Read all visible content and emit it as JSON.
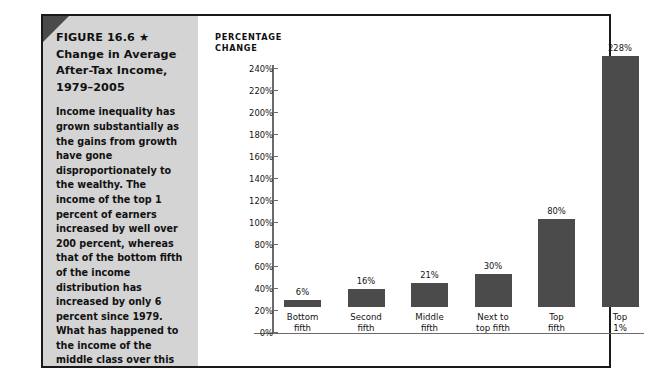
{
  "figure": {
    "title_line1": "FIGURE 16.6 ★",
    "title_line2": "Change in Average",
    "title_line3": "After-Tax Income,",
    "title_line4": "1979–2005",
    "body": "Income inequality has grown substantially as the gains from growth have gone disproportionately to the wealthy. The income of the top 1 percent of earners increased by well over 200 percent, whereas that of the bottom fifth of the income distribution has increased by only 6 percent since 1979. What has happened to the income of the middle class over this time period?",
    "source": "SOURCE: Center on Budget and Policy Priorities, www.cbpp.org/12-14-07inc .htm (accessed 3/19/08).",
    "accent_panel_color": "#d4d4d4",
    "corner_fold_color": "#4a4a4a",
    "frame_color": "#1a1a1a"
  },
  "chart_data": {
    "type": "bar",
    "title": "Change in Average After-Tax Income, 1979–2005",
    "axis_heading": "PERCENTAGE\nCHANGE",
    "xlabel": "",
    "ylabel": "PERCENTAGE CHANGE",
    "ylim": [
      0,
      240
    ],
    "ytick_step": 20,
    "grid": false,
    "legend": "none",
    "bar_color": "#4b4b4b",
    "axis_color": "#6b6b6b",
    "ytick_labels": [
      "240%",
      "220%",
      "200%",
      "180%",
      "160%",
      "140%",
      "120%",
      "100%",
      "80%",
      "60%",
      "40%",
      "20%",
      "0%"
    ],
    "ytick_values": [
      240,
      220,
      200,
      180,
      160,
      140,
      120,
      100,
      80,
      60,
      40,
      20,
      0
    ],
    "categories": [
      "Bottom\nfifth",
      "Second\nfifth",
      "Middle\nfifth",
      "Next to\ntop fifth",
      "Top\nfifth",
      "Top\n1%"
    ],
    "values": [
      6,
      16,
      21,
      30,
      80,
      228
    ],
    "value_labels": [
      "6%",
      "16%",
      "21%",
      "30%",
      "80%",
      "228%"
    ]
  }
}
